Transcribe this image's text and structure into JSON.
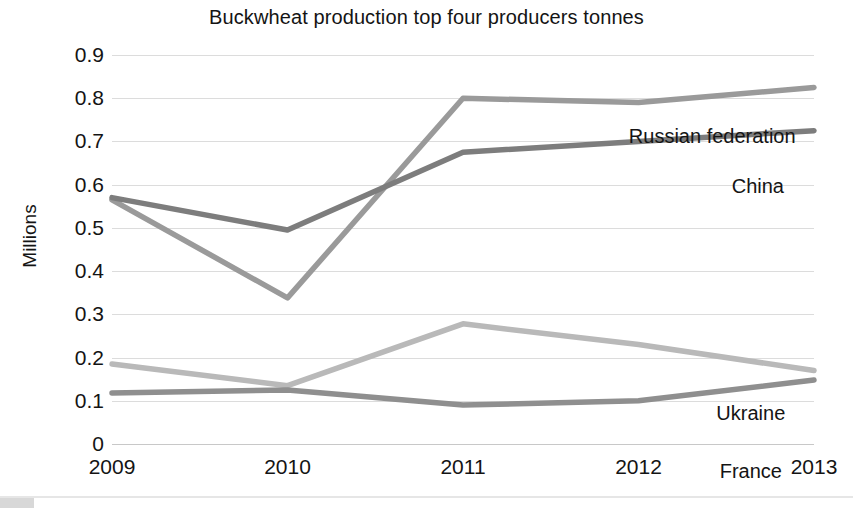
{
  "chart_data": {
    "type": "line",
    "title": "Buckwheat production top four producers tonnes",
    "xlabel": "",
    "ylabel": "Millions",
    "x": [
      "2009",
      "2010",
      "2011",
      "2012",
      "2013"
    ],
    "categories": [
      "2009",
      "2010",
      "2011",
      "2012",
      "2013"
    ],
    "ylim": [
      0,
      0.9
    ],
    "yticks": [
      "0",
      "0.1",
      "0.2",
      "0.3",
      "0.4",
      "0.5",
      "0.6",
      "0.7",
      "0.8",
      "0.9"
    ],
    "ytick_values": [
      0,
      0.1,
      0.2,
      0.3,
      0.4,
      0.5,
      0.6,
      0.7,
      0.8,
      0.9
    ],
    "grid": true,
    "legend_position": "inline-right-of-lines",
    "series": [
      {
        "name": "Russian federation",
        "values": [
          0.565,
          0.338,
          0.8,
          0.79,
          0.825
        ],
        "color": "#9a9a9a",
        "label_x_pct": 85.5,
        "label_y_px": 70
      },
      {
        "name": "China",
        "values": [
          0.57,
          0.495,
          0.675,
          0.7,
          0.725
        ],
        "color": "#7d7d7d",
        "label_x_pct": 92.0,
        "label_y_px": 120
      },
      {
        "name": "Ukraine",
        "values": [
          0.185,
          0.135,
          0.278,
          0.23,
          0.17
        ],
        "color": "#b9b9b9",
        "label_x_pct": 91.0,
        "label_y_px": 347
      },
      {
        "name": "France",
        "values": [
          0.118,
          0.125,
          0.09,
          0.1,
          0.148
        ],
        "color": "#8f8f8f",
        "label_x_pct": 91.0,
        "label_y_px": 405
      }
    ]
  }
}
